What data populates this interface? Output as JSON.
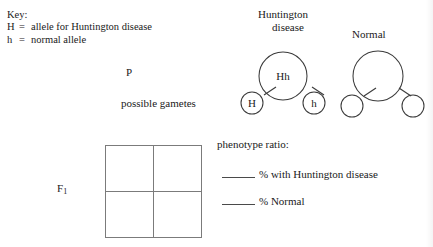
{
  "key": {
    "title": "Key:",
    "entries": [
      {
        "symbol": "H",
        "equals": "=",
        "meaning": "allele for Huntington disease"
      },
      {
        "symbol": "h",
        "equals": "=",
        "meaning": "normal allele"
      }
    ]
  },
  "cross": {
    "generation_label": "P",
    "gametes_label": "possible gametes",
    "parents": [
      {
        "heading_line1": "Huntington",
        "heading_line2": "disease",
        "genotype": "Hh",
        "gametes": [
          "H",
          "h"
        ]
      },
      {
        "heading_line1": "Normal",
        "heading_line2": "",
        "genotype": "",
        "gametes": [
          "",
          ""
        ]
      }
    ]
  },
  "punnett": {
    "label": "F",
    "label_subscript": "1",
    "cells": [
      "",
      "",
      "",
      ""
    ]
  },
  "phenotype_ratio": {
    "title": "phenotype ratio:",
    "lines": [
      {
        "blank": "",
        "text": "% with Huntington disease"
      },
      {
        "blank": "",
        "text": "% Normal"
      }
    ]
  },
  "colors": {
    "ink": "#1a1a1a",
    "stroke": "#3b3b3b",
    "grid": "#7b7b7b",
    "paper": "#ffffff"
  }
}
